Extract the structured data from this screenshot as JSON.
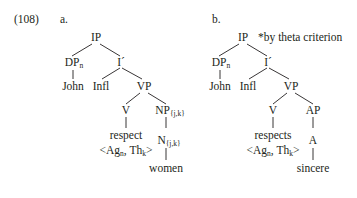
{
  "example_number": "(108)",
  "trees": [
    {
      "label": "a.",
      "root": "IP",
      "annotation": "",
      "subject": {
        "cat": "DP",
        "sub": "n",
        "word": "John"
      },
      "ibar": "I´",
      "infl": "Infl",
      "vp": "VP",
      "verb": {
        "cat": "V",
        "word": "respect",
        "grid_open": "<Ag",
        "grid_sub1": "n",
        "grid_mid": ", Th",
        "grid_sub2": "k",
        "grid_close": ">"
      },
      "complement": {
        "phrase": "NP",
        "phrase_sub": "{j,k}",
        "head": "N",
        "head_sub": "{j,k}",
        "word": "women"
      }
    },
    {
      "label": "b.",
      "root": "IP",
      "annotation": "*by theta criterion",
      "subject": {
        "cat": "DP",
        "sub": "n",
        "word": "John"
      },
      "ibar": "I´",
      "infl": "Infl",
      "vp": "VP",
      "verb": {
        "cat": "V",
        "word": "respects",
        "grid_open": "<Ag",
        "grid_sub1": "n",
        "grid_mid": ", Th",
        "grid_sub2": "k",
        "grid_close": ">"
      },
      "complement": {
        "phrase": "AP",
        "phrase_sub": "",
        "head": "A",
        "head_sub": "",
        "word": "sincere"
      }
    }
  ]
}
